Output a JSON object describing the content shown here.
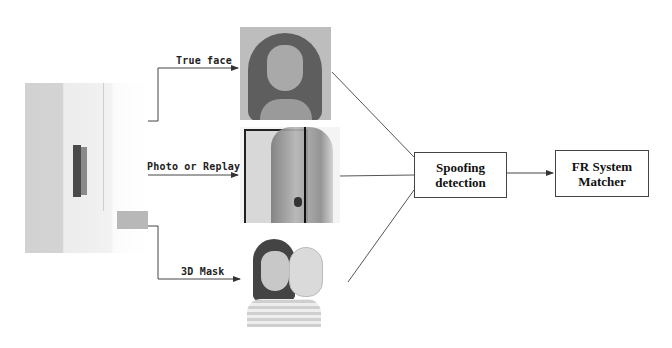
{
  "diagram": {
    "source": {
      "label": "",
      "icon": "face-recognition-kiosk"
    },
    "branches": [
      {
        "label": "True face",
        "image": "genuine-face-photo"
      },
      {
        "label": "Photo or Replay",
        "image": "printed-photo-attack"
      },
      {
        "label": "3D Mask",
        "image": "mask-attack-photo"
      }
    ],
    "nodes": [
      {
        "id": "spoofing",
        "lines": [
          "Spoofing",
          "detection"
        ]
      },
      {
        "id": "fr",
        "lines": [
          "FR System",
          "Matcher"
        ]
      }
    ],
    "colors": {
      "line": "#444444",
      "box_border": "#444444",
      "text": "#111111",
      "background": "#ffffff"
    }
  }
}
